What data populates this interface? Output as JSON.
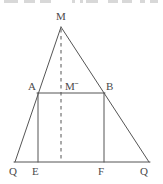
{
  "figure": {
    "name": "isosceles-triangle-with-inscribed-rectangle",
    "canvas": {
      "width": 163,
      "height": 184
    },
    "stroke_color": "#555555",
    "label_color": "#4a4a4a",
    "background_color": "#ffffff",
    "stroke_width": 1
  },
  "labels": {
    "apex": "M",
    "rect_top_left": "A",
    "rect_top_right": "B",
    "center_point": "Mˉ",
    "base_left": "Q",
    "base_foot_left": "E",
    "base_foot_right": "F",
    "base_right": "Q"
  },
  "points": {
    "M": {
      "x": 61,
      "y": 27
    },
    "A": {
      "x": 38,
      "y": 93
    },
    "B": {
      "x": 104,
      "y": 93
    },
    "E": {
      "x": 38,
      "y": 162
    },
    "F": {
      "x": 104,
      "y": 162
    },
    "Q_left": {
      "x": 15,
      "y": 162
    },
    "Q_right": {
      "x": 149,
      "y": 162
    },
    "M_prime": {
      "x": 61,
      "y": 93
    }
  },
  "label_positions": {
    "apex": {
      "x": 56,
      "y": 11
    },
    "rect_top_left": {
      "x": 28,
      "y": 81
    },
    "center_point": {
      "x": 65,
      "y": 81
    },
    "rect_top_right": {
      "x": 106,
      "y": 81
    },
    "base_left": {
      "x": 9,
      "y": 166
    },
    "base_foot_left": {
      "x": 32,
      "y": 166
    },
    "base_foot_right": {
      "x": 98,
      "y": 166
    },
    "base_right": {
      "x": 140,
      "y": 166
    }
  },
  "segments": [
    {
      "name": "side-MQ-left",
      "from": "M",
      "to": "Q_left",
      "style": "solid"
    },
    {
      "name": "side-MQ-right",
      "from": "M",
      "to": "Q_right",
      "style": "solid"
    },
    {
      "name": "base-QQ",
      "from": "Q_left",
      "to": "Q_right",
      "style": "solid"
    },
    {
      "name": "rect-top-AB",
      "from": "A",
      "to": "B",
      "style": "solid"
    },
    {
      "name": "rect-left-AE",
      "from": "A",
      "to": "E",
      "style": "solid"
    },
    {
      "name": "rect-right-BF",
      "from": "B",
      "to": "F",
      "style": "solid"
    },
    {
      "name": "median-altitude-MMprime",
      "from": "M",
      "to": "F_center",
      "style": "dashed"
    }
  ],
  "top_artifacts": [
    {
      "x": 4,
      "w": 14
    },
    {
      "x": 24,
      "w": 11
    },
    {
      "x": 40,
      "w": 11
    },
    {
      "x": 72,
      "w": 3
    },
    {
      "x": 80,
      "w": 3
    },
    {
      "x": 86,
      "w": 12
    },
    {
      "x": 108,
      "w": 10
    },
    {
      "x": 122,
      "w": 10
    },
    {
      "x": 140,
      "w": 5
    },
    {
      "x": 150,
      "w": 8
    }
  ]
}
